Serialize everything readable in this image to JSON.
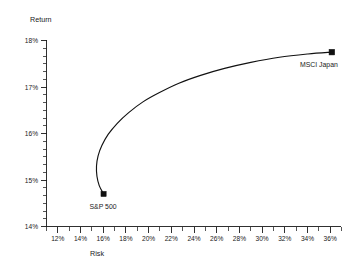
{
  "chart_data": {
    "type": "line",
    "title": "",
    "xlabel": "Risk",
    "ylabel": "Return",
    "xlim": [
      11,
      36.8
    ],
    "ylim": [
      14,
      18
    ],
    "grid": false,
    "legend": "none",
    "x_tick_labels": [
      "12%",
      "14%",
      "16%",
      "18%",
      "20%",
      "22%",
      "24%",
      "26%",
      "28%",
      "30%",
      "32%",
      "34%",
      "36%"
    ],
    "x_tick_values": [
      12,
      14,
      16,
      18,
      20,
      22,
      24,
      26,
      28,
      30,
      32,
      34,
      36
    ],
    "y_tick_labels": [
      "14%",
      "15%",
      "16%",
      "17%",
      "18%"
    ],
    "y_tick_values": [
      14,
      15,
      16,
      17,
      18
    ],
    "x_minor_per_major": 2,
    "y_minor_per_major": 5,
    "series": [
      {
        "name": "Efficient frontier",
        "points": [
          [
            16.0,
            14.7
          ],
          [
            15.62,
            14.88
          ],
          [
            15.42,
            15.08
          ],
          [
            15.38,
            15.3
          ],
          [
            15.52,
            15.52
          ],
          [
            15.85,
            15.74
          ],
          [
            16.4,
            15.98
          ],
          [
            17.2,
            16.22
          ],
          [
            18.2,
            16.45
          ],
          [
            19.45,
            16.68
          ],
          [
            20.9,
            16.88
          ],
          [
            22.6,
            17.08
          ],
          [
            24.5,
            17.25
          ],
          [
            26.6,
            17.4
          ],
          [
            28.9,
            17.53
          ],
          [
            31.4,
            17.64
          ],
          [
            33.9,
            17.71
          ],
          [
            36.0,
            17.75
          ]
        ]
      }
    ],
    "annotations": [
      {
        "name": "sp500",
        "label": "S&P 500",
        "x": 16.0,
        "y": 14.7,
        "marker": "filled-square"
      },
      {
        "name": "msci-japan",
        "label": "MSCI Japan",
        "x": 36.0,
        "y": 17.75,
        "marker": "filled-square"
      }
    ]
  }
}
